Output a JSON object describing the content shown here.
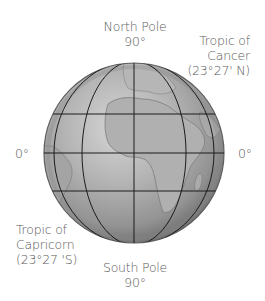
{
  "diagram": {
    "type": "globe-latitude-diagram",
    "labels": {
      "north_pole": {
        "name": "North Pole",
        "degrees": "90°"
      },
      "south_pole": {
        "name": "South Pole",
        "degrees": "90°"
      },
      "tropic_cancer": {
        "line1": "Tropic of",
        "line2": "Cancer",
        "line3": "(23°27' N)"
      },
      "tropic_capricorn": {
        "line1": "Tropic of",
        "line2": "Capricorn",
        "line3": "(23°27 'S)"
      },
      "equator_left": "0°",
      "equator_right": "0°"
    },
    "colors": {
      "globe_light": "#c8c8c8",
      "globe_mid": "#a0a0a0",
      "globe_dark": "#6e6e6e",
      "grid_lines": "#1a1a1a",
      "text": "#5a5a5a"
    }
  }
}
